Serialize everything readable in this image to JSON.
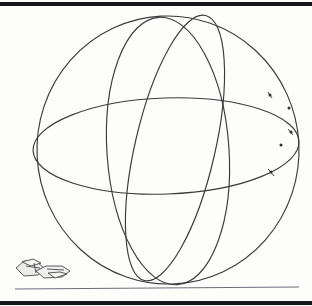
{
  "document": {
    "kind": "scanned-technical-drawing",
    "title": "",
    "caption": "",
    "background_color": "#fdfdfc",
    "ink_color": "#3a3a3a",
    "rule_color": "#15151a",
    "ground_line_color": "#6e6e76",
    "width": 312,
    "height": 306
  },
  "frame": {
    "top_rule": {
      "label": "",
      "x1": 0,
      "y1": 4,
      "x2": 312,
      "y2": 4,
      "thickness": 4.5
    },
    "bottom_rule": {
      "label": "",
      "x1": 0,
      "y1": 303,
      "x2": 312,
      "y2": 303,
      "thickness": 4.0
    }
  },
  "ground": {
    "label": "",
    "x1": 15,
    "y1": 289,
    "x2": 299,
    "y2": 287,
    "thickness": 1.2
  },
  "chart_data": {
    "type": "line",
    "title": "Wireframe sphere with great circles",
    "subtitle": "",
    "xlabel": "",
    "ylabel": "",
    "grid": false,
    "legend": "none",
    "xlim": [
      0,
      312
    ],
    "ylim": [
      0,
      306
    ],
    "annotations": [],
    "series": [
      {
        "name": "sphere-outline",
        "kind": "ellipse",
        "cx": 168,
        "cy": 150,
        "rx": 131,
        "ry": 134,
        "rotation": -3,
        "stroke": "#3a3a3a",
        "stroke_width": 1.15
      },
      {
        "name": "equator-circle",
        "kind": "ellipse",
        "cx": 166,
        "cy": 146,
        "rx": 133,
        "ry": 48,
        "rotation": -2,
        "stroke": "#3a3a3a",
        "stroke_width": 1.15
      },
      {
        "name": "meridian-circle-front",
        "kind": "ellipse",
        "cx": 168,
        "cy": 151,
        "rx": 61,
        "ry": 134,
        "rotation": -4,
        "stroke": "#3a3a3a",
        "stroke_width": 1.15
      },
      {
        "name": "meridian-circle-oblique",
        "kind": "ellipse",
        "cx": 175,
        "cy": 148,
        "rx": 40,
        "ry": 136,
        "rotation": 13,
        "stroke": "#3a3a3a",
        "stroke_width": 1.15
      }
    ],
    "markers": [
      {
        "name": "node-upper-right",
        "x": 270,
        "y": 95,
        "size": 2.1
      },
      {
        "name": "node-right-upper",
        "x": 289,
        "y": 108,
        "size": 2.1
      },
      {
        "name": "node-right-mid",
        "x": 291,
        "y": 132,
        "size": 2.1
      },
      {
        "name": "node-right-lower",
        "x": 271,
        "y": 172,
        "size": 2.1
      },
      {
        "name": "node-right-edge",
        "x": 281,
        "y": 145,
        "size": 2.1
      }
    ]
  },
  "sketch": {
    "name": "aircraft-sketch",
    "label": "",
    "origin_x": 14,
    "origin_y": 257,
    "width": 58,
    "height": 30,
    "stroke": "#4a4a4a",
    "fill": "#e8e8e6"
  }
}
